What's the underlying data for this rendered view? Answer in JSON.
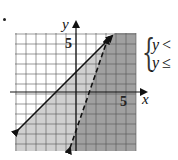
{
  "problem": {
    "bullet": "•",
    "system": [
      {
        "lhs": "y",
        "op": "<"
      },
      {
        "lhs": "y",
        "op": "≤"
      }
    ]
  },
  "chart_data": {
    "type": "inequality-graph",
    "title": "",
    "xlabel": "x",
    "ylabel": "y",
    "xlim": [
      -6,
      6
    ],
    "ylim": [
      -6,
      6
    ],
    "grid": true,
    "tick_labels": {
      "x": [
        "5"
      ],
      "y": [
        "5"
      ]
    },
    "lines": [
      {
        "name": "solid boundary",
        "style": "solid",
        "arrows": "both",
        "points": [
          [
            -5.8,
            -3.8
          ],
          [
            3.6,
            5.6
          ]
        ],
        "slope": 1,
        "intercept": 2
      },
      {
        "name": "dashed boundary",
        "style": "dashed",
        "arrows": "both",
        "points": [
          [
            -0.6,
            -5.6
          ],
          [
            3.2,
            5.4
          ]
        ],
        "slope": 3,
        "intercept": -4
      }
    ],
    "shading": [
      {
        "region": "light",
        "description": "below solid line",
        "color": "#c8c8c8"
      },
      {
        "region": "dark",
        "description": "below both lines (solution region)",
        "color": "#9a9a9a"
      }
    ],
    "colors": {
      "grid": "#555555",
      "axes": "#111111",
      "light_shade": "#cfcfcf",
      "dark_shade": "#a0a0a0"
    }
  }
}
